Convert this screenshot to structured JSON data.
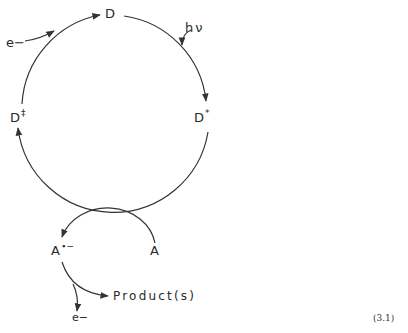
{
  "diagram": {
    "type": "photoredox catalytic cycle",
    "nodes": {
      "D": {
        "label": "D"
      },
      "D_excited": {
        "label": "D",
        "superscript": "*"
      },
      "D_oxidized": {
        "label": "D",
        "superscript": "‡"
      },
      "A": {
        "label": "A"
      },
      "A_reduced": {
        "label": "A",
        "superscript": "∙−"
      },
      "product": {
        "label": "Product(s)"
      }
    },
    "inputs": {
      "light": {
        "label": "hν"
      },
      "electron_in": {
        "label": "e−"
      },
      "electron_out": {
        "label": "e−"
      }
    },
    "edges": [
      {
        "from": "D",
        "to": "D*",
        "via": "hν"
      },
      {
        "from": "D*",
        "to": "D‡"
      },
      {
        "from": "D‡",
        "to": "D",
        "via": "e−"
      },
      {
        "from": "A",
        "to": "A∙−"
      },
      {
        "from": "A∙−",
        "to": "Product(s)",
        "releases": "e−"
      }
    ],
    "equation_number": "(3.1)",
    "line_color": "#333333"
  }
}
